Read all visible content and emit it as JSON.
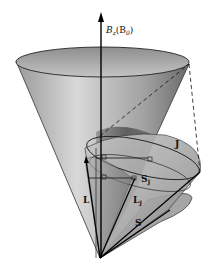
{
  "diagram": {
    "axis_label": "B_z(B_0)",
    "axis_label_main": "B",
    "axis_label_sub": "z",
    "axis_label_paren": "(B",
    "axis_label_paren_sub": "0",
    "axis_label_close": ")",
    "vectors": {
      "L": "L",
      "S": "S",
      "J": "J",
      "LJ_main": "L",
      "LJ_sub": "J",
      "SJ_main": "S",
      "SJ_sub": "J"
    },
    "colors": {
      "cone_dark": "#6e6e6e",
      "cone_mid": "#a8a8a8",
      "cone_light": "#d4d4d4",
      "line": "#111111",
      "background": "#ffffff"
    }
  }
}
